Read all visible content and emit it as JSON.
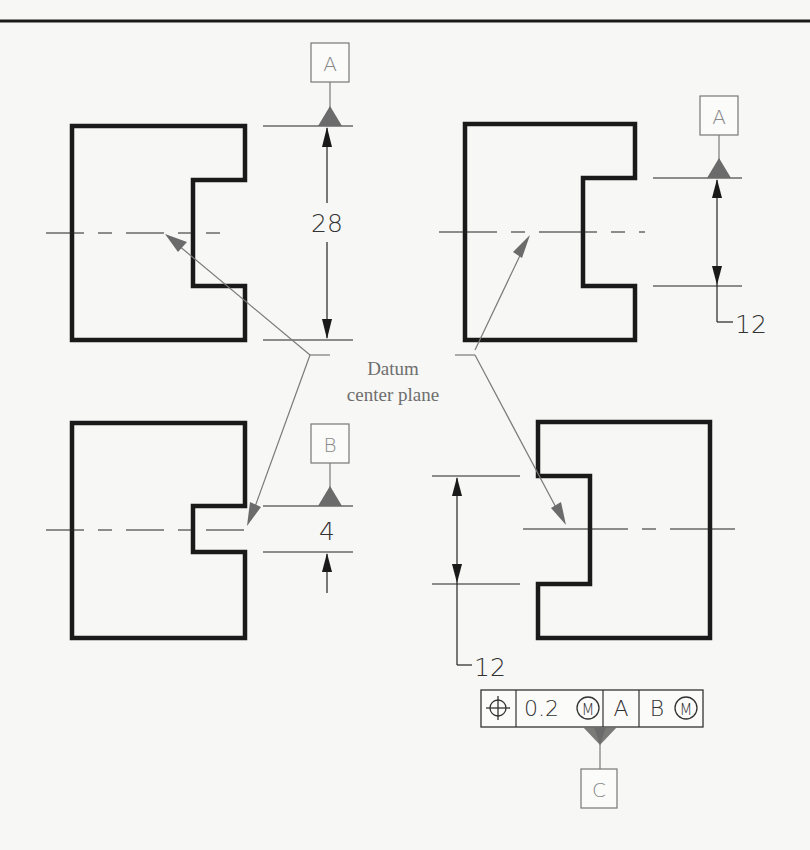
{
  "figure": {
    "callout": {
      "line1": "Datum",
      "line2": "center plane"
    },
    "views": [
      {
        "id": "top-left",
        "datum_label": "A",
        "dimension": "28",
        "description": "Datum A applied to overall width; center plane through whole part"
      },
      {
        "id": "top-right",
        "datum_label": "A",
        "dimension": "12",
        "description": "Datum A applied to slot width; center plane through slot"
      },
      {
        "id": "bottom-left",
        "datum_label": "B",
        "dimension": "4",
        "description": "Datum B applied to narrow slot; center plane through slot"
      },
      {
        "id": "bottom-right",
        "dimension": "12",
        "description": "Feature control frame with datum C attached"
      }
    ],
    "feature_control_frame": {
      "symbol": "position-icon",
      "tolerance": "0.2",
      "tolerance_modifier": "M",
      "primary_datum": "A",
      "secondary_datum": "B",
      "secondary_modifier": "M",
      "attached_datum": "C"
    }
  },
  "colors": {
    "background": "#f7f7f5",
    "outline": "#1a1a1a",
    "leader": "#7a7a7a",
    "datum_triangle": "#6b6b6b"
  }
}
